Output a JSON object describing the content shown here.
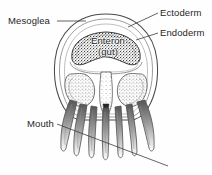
{
  "figure": {
    "kind": "biological-cross-section-diagram",
    "background_color": "#fefefe",
    "ink_color": "#3a3a3a",
    "text_color": "#262626"
  },
  "labels": {
    "mesoglea": "Mesoglea",
    "ectoderm": "Ectoderm",
    "endoderm": "Endoderm",
    "enteron_line1": "Enteron",
    "enteron_line2": "(gut)",
    "mouth": "Mouth"
  },
  "leaders": {
    "mesoglea": "horizontal line from label right edge to outer bell wall",
    "ectoderm": "horizontal line from label left edge to outer bell surface",
    "endoderm": "horizontal line from label left edge to inner gut lining",
    "mouth": "long diagonal line from label up-right through the manubrium, continuing down-right past the tentacles"
  },
  "structures": [
    {
      "name": "bell-outer-wall",
      "description": "outer ectoderm surface of the bell"
    },
    {
      "name": "mesoglea-layer",
      "description": "jelly layer between the two concentric bell outlines"
    },
    {
      "name": "bell-inner-wall",
      "description": "inner lining of the bell cavity"
    },
    {
      "name": "enteron-cavity",
      "description": "dark stippled gastric cavity spanning the upper bell"
    },
    {
      "name": "radial-canal-left",
      "description": "left stippled radial pouch"
    },
    {
      "name": "radial-canal-right",
      "description": "right stippled radial pouch"
    },
    {
      "name": "manubrium",
      "description": "central column bearing the mouth opening"
    },
    {
      "name": "tentacle-group",
      "description": "set of tapering oral arms / tentacles hanging below the bell"
    }
  ]
}
